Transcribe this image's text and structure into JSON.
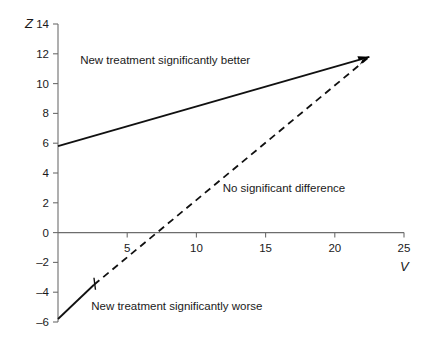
{
  "chart_data": {
    "type": "line",
    "title": "",
    "xlabel": "V",
    "ylabel": "Z",
    "xlim": [
      0,
      25
    ],
    "ylim": [
      -6,
      14
    ],
    "grid": false,
    "legend": "none",
    "x_ticks": [
      5,
      10,
      15,
      20,
      25
    ],
    "x_tick_labels": [
      "5",
      "10",
      "15",
      "20",
      "25"
    ],
    "y_ticks": [
      14,
      12,
      10,
      8,
      6,
      4,
      2,
      0,
      -2,
      -4,
      -6
    ],
    "y_tick_labels": [
      "14",
      "12",
      "10",
      "8",
      "6",
      "4",
      "2",
      "0",
      "–2",
      "–4",
      "–6"
    ],
    "series": [
      {
        "name": "upper-boundary",
        "style": "solid",
        "points": [
          [
            0,
            5.8
          ],
          [
            22.5,
            11.8
          ]
        ]
      },
      {
        "name": "lower-boundary-solid-segment",
        "style": "solid",
        "points": [
          [
            0,
            -5.8
          ],
          [
            2.6,
            -3.5
          ]
        ]
      },
      {
        "name": "lower-boundary-dashed-segment",
        "style": "dashed",
        "points": [
          [
            2.6,
            -3.5
          ],
          [
            22.5,
            11.8
          ]
        ]
      }
    ],
    "annotations": [
      {
        "name": "region-better",
        "text": "New treatment significantly better",
        "x": 1.6,
        "y": 11.6
      },
      {
        "name": "region-no-difference",
        "text": "No significant difference",
        "x": 11.9,
        "y": 3.0
      },
      {
        "name": "region-worse",
        "text": "New treatment significantly worse",
        "x": 2.4,
        "y": -4.9
      }
    ],
    "markers": [
      {
        "name": "boundary-transition-tick",
        "x": 2.6,
        "y": -3.5
      }
    ],
    "arrows": [
      {
        "name": "convergence-arrowhead",
        "x": 22.5,
        "y": 11.8
      }
    ],
    "colors": {
      "line": "#111111",
      "axis": "#6d6d6d",
      "text": "#1a1a1a",
      "background": "#ffffff"
    }
  }
}
